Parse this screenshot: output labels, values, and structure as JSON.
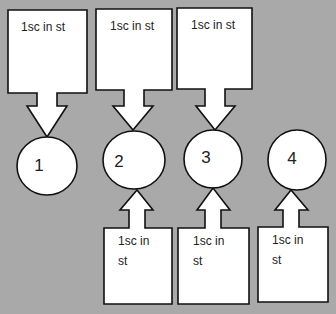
{
  "background_color": "#a9a9a9",
  "top_boxes": [
    {
      "label": "1sc in st"
    },
    {
      "label": "1sc in st"
    },
    {
      "label": "1sc in st"
    }
  ],
  "nodes": [
    {
      "label": "1"
    },
    {
      "label": "2"
    },
    {
      "label": "3"
    },
    {
      "label": "4"
    }
  ],
  "bottom_boxes": [
    {
      "line1": "1sc in",
      "line2": "st"
    },
    {
      "line1": "1sc in",
      "line2": "st"
    },
    {
      "line1": "1sc in",
      "line2": "st"
    }
  ]
}
